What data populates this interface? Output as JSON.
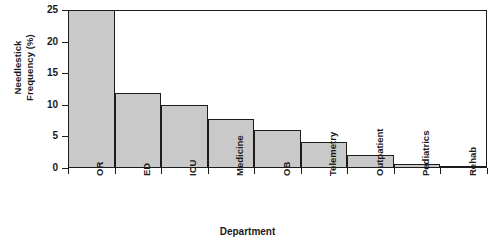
{
  "chart_data": {
    "type": "bar",
    "title": "",
    "xlabel": "Department",
    "ylabel": "Needlestick\nFrequency (%)",
    "categories": [
      "OR",
      "ED",
      "ICU",
      "Medicine",
      "OB",
      "Telemetry",
      "Outpatient",
      "Pediatrics",
      "Rehab"
    ],
    "values": [
      25,
      11.8,
      10,
      7.8,
      6,
      4.1,
      2,
      0.6,
      0.2
    ],
    "value_note": "OR bar is clipped at the axis maximum of 25%",
    "ylim": [
      0,
      25
    ],
    "yticks": [
      0,
      5,
      10,
      15,
      20,
      25
    ],
    "ytick_labels": [
      "0",
      "5",
      "10",
      "15",
      "20",
      "25"
    ],
    "grid": false,
    "legend": "none",
    "bar_fill_color": "#c9c9c9",
    "bar_edge_color": "#1c1c1c",
    "background_color": "#ffffff"
  },
  "axes": {
    "y_title": "Needlestick\nFrequency (%)",
    "x_title": "Department"
  },
  "caption": {
    "partial_text": ""
  }
}
